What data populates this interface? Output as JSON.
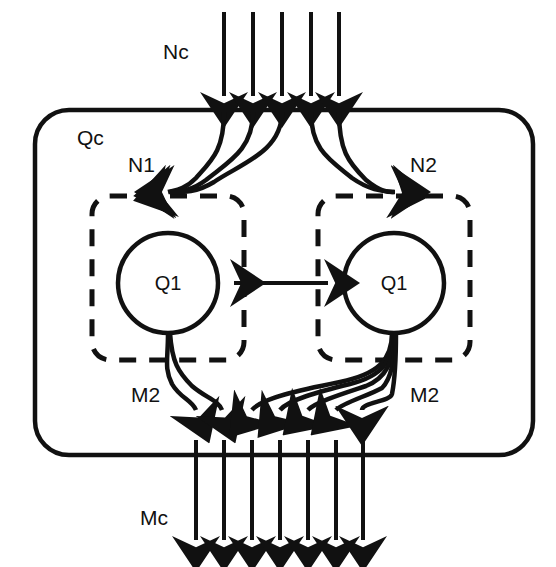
{
  "diagram": {
    "type": "queueing-network-block-diagram",
    "background_color": "#ffffff",
    "stroke_color": "#111111",
    "labels": {
      "input_stream": "Nc",
      "outer_system": "Qc",
      "left_branch_input": "N1",
      "right_branch_input": "N2",
      "left_branch_output": "M2",
      "right_branch_output": "M2",
      "output_stream": "Mc",
      "left_node": "Q1",
      "right_node": "Q1"
    },
    "arrow_counts": {
      "input_top": 5,
      "input_to_left_branch": 3,
      "input_to_right_branch": 2,
      "left_branch_to_output": 2,
      "right_branch_to_output": 5,
      "output_bottom": 7
    },
    "elements": {
      "outer_container": {
        "name": "Qc",
        "shape": "rounded-rectangle",
        "style": "solid",
        "x": 35,
        "y": 110,
        "width": 498,
        "height": 345,
        "radius": 34
      },
      "left_subsystem": {
        "shape": "rounded-rectangle",
        "style": "dashed",
        "x": 92,
        "y": 196,
        "width": 152,
        "height": 164,
        "radius": 18
      },
      "right_subsystem": {
        "shape": "rounded-rectangle",
        "style": "dashed",
        "x": 318,
        "y": 196,
        "width": 152,
        "height": 164,
        "radius": 18
      },
      "left_node_circle": {
        "cx": 168,
        "cy": 283,
        "r": 50
      },
      "right_node_circle": {
        "cx": 394,
        "cy": 283,
        "r": 50
      },
      "bidirectional_link": {
        "x1": 224,
        "y1": 283,
        "x2": 338,
        "y2": 283,
        "style": "double-headed"
      }
    }
  }
}
